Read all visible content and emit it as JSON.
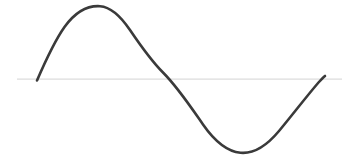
{
  "figure": {
    "background_color": "#ffffff",
    "width": 355,
    "height": 167,
    "title": "",
    "caption": ""
  },
  "chart_data": {
    "type": "line",
    "title": "",
    "subtitle": "",
    "xlabel": "",
    "ylabel": "",
    "grid": false,
    "legend": null,
    "legend_position": "none",
    "annotations": [],
    "xticks": [],
    "yticks": [],
    "xtick_labels": [],
    "ytick_labels": [],
    "xlim": [
      0,
      360
    ],
    "ylim": [
      -1.05,
      1.05
    ],
    "baseline_value": 0,
    "series": [
      {
        "name": "sine",
        "function": "sin(x)",
        "color": "#3a3a3a",
        "line_width": 2.6,
        "x": [
          0,
          15,
          30,
          45,
          60,
          75,
          90,
          105,
          120,
          135,
          150,
          165,
          180,
          195,
          210,
          225,
          240,
          255,
          270,
          285,
          300,
          315,
          330,
          345,
          360
        ],
        "values": [
          0,
          0.259,
          0.5,
          0.707,
          0.866,
          0.966,
          1,
          0.966,
          0.866,
          0.707,
          0.5,
          0.259,
          0,
          -0.259,
          -0.5,
          -0.707,
          -0.866,
          -0.966,
          -1,
          -0.966,
          -0.866,
          -0.707,
          -0.5,
          -0.259,
          0
        ],
        "key_points": {
          "start": {
            "x": 0,
            "y": 0,
            "px": [
              37,
              80
            ]
          },
          "peak": {
            "x": 90,
            "y": 1,
            "px": [
              105,
              7
            ]
          },
          "zero_crossing": {
            "x": 180,
            "y": 0,
            "px": [
              172,
              78
            ]
          },
          "trough": {
            "x": 270,
            "y": -1,
            "px": [
              245,
              152
            ]
          },
          "end": {
            "x": 360,
            "y": 0,
            "px": [
              325,
              76
            ]
          }
        }
      }
    ],
    "axis": {
      "name": "zero-axis",
      "color": "#dcdcdc",
      "line_width": 1.2,
      "orientation": "horizontal",
      "y_value": 0,
      "px_y": 79,
      "px_x_start": 17,
      "px_x_end": 342
    }
  },
  "paths": {
    "axis_line": "M 17 79.2 L 342 79.2",
    "sine_curve": "M 37.0 80.5 C 45.0 62.0 53.5 42.5 64.5 27.0 C 76.0 11.0 89.0 5.5 100.0 6.2 C 110.5 6.9 120.5 16.0 130.0 30.0 C 141.5 47.0 153.0 62.5 163.0 72.5 C 178.0 87.5 191.5 108.0 203.0 124.5 C 214.5 141.0 227.5 151.5 240.5 152.8 C 253.5 154.0 266.5 146.0 279.0 131.0 C 292.0 115.5 306.0 97.0 318.5 82.5 C 321.5 79.2 323.5 77.2 325.0 76.0"
  }
}
